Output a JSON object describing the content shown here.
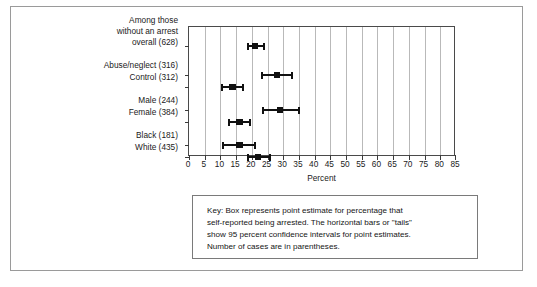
{
  "chart_data": {
    "type": "scatter",
    "title": "",
    "subtitle": "",
    "xlabel": "Percent",
    "ylabel": "",
    "xlim": [
      0,
      85
    ],
    "xticks": [
      0,
      5,
      10,
      15,
      20,
      25,
      30,
      35,
      40,
      45,
      50,
      55,
      60,
      65,
      70,
      75,
      80,
      85
    ],
    "xtick_labels": [
      "0",
      "5",
      "10",
      "15",
      "20",
      "25",
      "30",
      "35",
      "40",
      "45",
      "50",
      "55",
      "60",
      "65",
      "70",
      "75",
      "80",
      "85"
    ],
    "grid": true,
    "grid_axis": "x",
    "legend_position": "none",
    "orientation": "horizontal",
    "marker": "square",
    "error_bars": "95% confidence interval",
    "categories": [
      "Among those without an arrest overall (628)",
      "Abuse/neglect (316)",
      "Control (312)",
      "Male (244)",
      "Female (384)",
      "Black (181)",
      "White (435)"
    ],
    "points": [
      {
        "label": "Among those without an arrest overall (628)",
        "n": 628,
        "value": 21.0,
        "ci_low": 18.8,
        "ci_high": 23.8
      },
      {
        "label": "Abuse/neglect (316)",
        "n": 316,
        "value": 28.0,
        "ci_low": 23.2,
        "ci_high": 32.8
      },
      {
        "label": "Control (312)",
        "n": 312,
        "value": 13.8,
        "ci_low": 10.6,
        "ci_high": 17.2
      },
      {
        "label": "Male (244)",
        "n": 244,
        "value": 29.0,
        "ci_low": 23.6,
        "ci_high": 35.0
      },
      {
        "label": "Female (384)",
        "n": 384,
        "value": 16.0,
        "ci_low": 12.8,
        "ci_high": 19.4
      },
      {
        "label": "Black (181)",
        "n": 181,
        "value": 16.0,
        "ci_low": 10.8,
        "ci_high": 21.0
      },
      {
        "label": "White (435)",
        "n": 435,
        "value": 22.0,
        "ci_low": 18.8,
        "ci_high": 25.8
      }
    ],
    "values": [
      21.0,
      28.0,
      13.8,
      29.0,
      16.0,
      16.0,
      22.0
    ]
  },
  "category_labels": [
    {
      "lines": [
        "Among those",
        "without an arrest",
        "overall (628)"
      ],
      "row": 0
    },
    {
      "lines": [
        "Abuse/neglect (316)"
      ],
      "row": 1
    },
    {
      "lines": [
        "Control (312)"
      ],
      "row": 2
    },
    {
      "lines": [
        "Male (244)"
      ],
      "row": 3
    },
    {
      "lines": [
        "Female (384)"
      ],
      "row": 4
    },
    {
      "lines": [
        "Black (181)"
      ],
      "row": 5
    },
    {
      "lines": [
        "White (435)"
      ],
      "row": 6
    }
  ],
  "labels": {
    "l0a": "Among those",
    "l0b": "without an arrest",
    "l0c": "overall (628)",
    "l1": "Abuse/neglect (316)",
    "l2": "Control (312)",
    "l3": "Male (244)",
    "l4": "Female (384)",
    "l5": "Black (181)",
    "l6": "White (435)"
  },
  "axis": {
    "title": "Percent",
    "ticks": [
      "0",
      "5",
      "10",
      "15",
      "20",
      "25",
      "30",
      "35",
      "40",
      "45",
      "50",
      "55",
      "60",
      "65",
      "70",
      "75",
      "80",
      "85"
    ]
  },
  "key": {
    "line1": "Key: Box represents point estimate for percentage that",
    "line2": "self-reported being arrested. The horizontal bars or \"tails\"",
    "line3": "show 95 percent confidence intervals for point estimates.",
    "line4": "Number of cases are in parentheses."
  },
  "colors": {
    "marker": "#111111",
    "gridline": "#b9b9b9",
    "axis": "#4a4a4a",
    "frame": "#9a9a9a",
    "background": "#ffffff"
  }
}
